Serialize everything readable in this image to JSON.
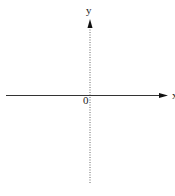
{
  "diagram": {
    "type": "coordinate-axes",
    "x_axis": {
      "label": "x",
      "style": "solid",
      "arrow": "right",
      "color": "#333333"
    },
    "y_axis": {
      "label": "y",
      "style": "dotted",
      "arrow": "up",
      "color": "#555555"
    },
    "origin": {
      "label": "0"
    }
  }
}
